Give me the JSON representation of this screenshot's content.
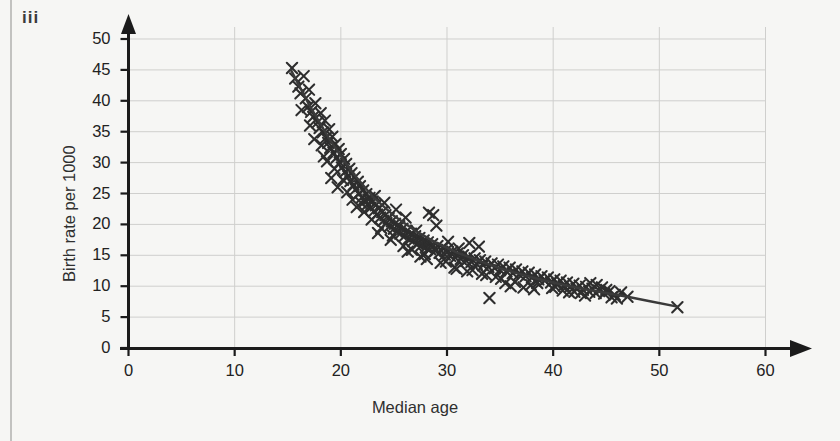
{
  "figure": {
    "part_label": "iii",
    "clipped_heading_above": "ggg",
    "background_color": "#f6f6f4",
    "marker_color": "#2e2e2e",
    "line_color": "#3a3a3a",
    "grid_color": "#cfcfcd",
    "axis_color": "#1b1b1b"
  },
  "chart_data": {
    "type": "scatter",
    "title": "",
    "xlabel": "Median age",
    "ylabel": "Birth rate per 1000",
    "xlim": [
      0,
      60
    ],
    "ylim": [
      0,
      50
    ],
    "xticks": [
      0,
      10,
      20,
      30,
      40,
      50,
      60
    ],
    "yticks": [
      0,
      5,
      10,
      15,
      20,
      25,
      30,
      35,
      40,
      45,
      50
    ],
    "grid": true,
    "legend": "none",
    "marker": "x",
    "series": [
      {
        "name": "Countries",
        "points": [
          [
            15.4,
            45.3
          ],
          [
            15.7,
            43.6
          ],
          [
            16.0,
            42.3
          ],
          [
            16.2,
            41.2
          ],
          [
            16.5,
            44.0
          ],
          [
            16.7,
            40.4
          ],
          [
            16.9,
            39.0
          ],
          [
            17.0,
            41.8
          ],
          [
            17.2,
            38.2
          ],
          [
            17.4,
            37.4
          ],
          [
            17.6,
            39.6
          ],
          [
            17.8,
            36.5
          ],
          [
            18.0,
            35.6
          ],
          [
            18.1,
            38.0
          ],
          [
            18.3,
            34.9
          ],
          [
            18.5,
            36.8
          ],
          [
            18.6,
            34.0
          ],
          [
            18.8,
            33.2
          ],
          [
            18.9,
            35.4
          ],
          [
            19.0,
            32.4
          ],
          [
            19.2,
            34.2
          ],
          [
            19.3,
            31.6
          ],
          [
            19.5,
            33.0
          ],
          [
            19.6,
            30.8
          ],
          [
            19.8,
            32.2
          ],
          [
            19.9,
            30.0
          ],
          [
            20.0,
            31.4
          ],
          [
            20.1,
            29.2
          ],
          [
            20.3,
            30.6
          ],
          [
            20.4,
            28.5
          ],
          [
            20.5,
            29.8
          ],
          [
            20.7,
            27.8
          ],
          [
            20.8,
            29.0
          ],
          [
            20.9,
            27.0
          ],
          [
            21.0,
            28.3
          ],
          [
            21.2,
            26.4
          ],
          [
            21.3,
            27.6
          ],
          [
            21.4,
            25.7
          ],
          [
            21.6,
            26.9
          ],
          [
            21.7,
            25.0
          ],
          [
            21.8,
            26.2
          ],
          [
            22.0,
            24.4
          ],
          [
            22.1,
            25.5
          ],
          [
            22.3,
            23.8
          ],
          [
            22.4,
            24.9
          ],
          [
            22.5,
            23.2
          ],
          [
            22.7,
            24.3
          ],
          [
            22.8,
            22.7
          ],
          [
            23.0,
            23.7
          ],
          [
            23.1,
            22.1
          ],
          [
            23.3,
            23.1
          ],
          [
            23.4,
            21.6
          ],
          [
            23.6,
            22.6
          ],
          [
            23.7,
            21.1
          ],
          [
            23.9,
            22.0
          ],
          [
            24.0,
            20.6
          ],
          [
            24.2,
            21.5
          ],
          [
            24.3,
            20.2
          ],
          [
            24.5,
            21.0
          ],
          [
            24.6,
            19.7
          ],
          [
            24.8,
            20.5
          ],
          [
            25.0,
            19.3
          ],
          [
            25.1,
            20.1
          ],
          [
            25.3,
            18.9
          ],
          [
            25.5,
            19.7
          ],
          [
            25.6,
            18.5
          ],
          [
            25.8,
            19.3
          ],
          [
            26.0,
            18.1
          ],
          [
            26.2,
            18.9
          ],
          [
            26.4,
            17.7
          ],
          [
            26.6,
            18.5
          ],
          [
            26.8,
            17.3
          ],
          [
            27.0,
            18.1
          ],
          [
            27.2,
            16.9
          ],
          [
            27.4,
            17.8
          ],
          [
            27.6,
            16.6
          ],
          [
            27.8,
            17.4
          ],
          [
            28.0,
            16.3
          ],
          [
            28.2,
            17.1
          ],
          [
            28.4,
            16.0
          ],
          [
            28.6,
            16.8
          ],
          [
            28.9,
            15.7
          ],
          [
            29.1,
            16.5
          ],
          [
            29.3,
            15.4
          ],
          [
            29.6,
            16.2
          ],
          [
            29.8,
            15.1
          ],
          [
            30.0,
            15.9
          ],
          [
            30.3,
            14.9
          ],
          [
            30.5,
            15.6
          ],
          [
            30.8,
            14.6
          ],
          [
            31.0,
            15.3
          ],
          [
            31.3,
            14.4
          ],
          [
            31.5,
            15.0
          ],
          [
            31.8,
            14.1
          ],
          [
            32.0,
            14.8
          ],
          [
            32.3,
            13.9
          ],
          [
            32.6,
            14.5
          ],
          [
            32.8,
            13.6
          ],
          [
            33.1,
            14.2
          ],
          [
            33.4,
            13.4
          ],
          [
            33.6,
            14.0
          ],
          [
            33.9,
            13.1
          ],
          [
            34.2,
            13.7
          ],
          [
            34.5,
            12.9
          ],
          [
            34.8,
            13.5
          ],
          [
            35.0,
            12.6
          ],
          [
            35.3,
            13.2
          ],
          [
            35.6,
            12.4
          ],
          [
            35.9,
            13.0
          ],
          [
            36.2,
            12.1
          ],
          [
            36.5,
            12.7
          ],
          [
            36.8,
            11.9
          ],
          [
            37.1,
            12.4
          ],
          [
            37.4,
            11.6
          ],
          [
            37.7,
            12.2
          ],
          [
            38.0,
            11.4
          ],
          [
            38.3,
            11.9
          ],
          [
            38.6,
            11.1
          ],
          [
            38.9,
            11.6
          ],
          [
            39.2,
            10.9
          ],
          [
            39.5,
            11.4
          ],
          [
            39.8,
            10.6
          ],
          [
            40.1,
            11.1
          ],
          [
            40.4,
            10.4
          ],
          [
            40.7,
            10.9
          ],
          [
            41.0,
            10.1
          ],
          [
            41.3,
            10.6
          ],
          [
            41.6,
            9.9
          ],
          [
            41.9,
            10.4
          ],
          [
            42.2,
            9.6
          ],
          [
            42.5,
            10.1
          ],
          [
            42.8,
            9.4
          ],
          [
            43.1,
            9.9
          ],
          [
            43.4,
            9.1
          ],
          [
            43.7,
            9.6
          ],
          [
            44.0,
            8.9
          ],
          [
            44.3,
            9.3
          ],
          [
            44.8,
            8.8
          ],
          [
            45.3,
            9.2
          ],
          [
            45.8,
            8.6
          ],
          [
            46.4,
            9.0
          ],
          [
            47.0,
            8.3
          ],
          [
            51.7,
            6.6
          ],
          [
            22.2,
            22.0
          ],
          [
            23.2,
            24.6
          ],
          [
            24.1,
            23.5
          ],
          [
            25.2,
            22.4
          ],
          [
            26.1,
            21.1
          ],
          [
            27.1,
            19.0
          ],
          [
            28.3,
            21.9
          ],
          [
            28.7,
            21.5
          ],
          [
            29.0,
            19.8
          ],
          [
            30.1,
            17.2
          ],
          [
            31.1,
            16.1
          ],
          [
            32.1,
            17.0
          ],
          [
            33.0,
            16.4
          ],
          [
            34.0,
            8.1
          ],
          [
            38.2,
            9.5
          ],
          [
            20.6,
            25.2
          ],
          [
            21.9,
            23.5
          ],
          [
            22.6,
            24.0
          ],
          [
            23.8,
            19.4
          ],
          [
            24.9,
            18.2
          ],
          [
            26.3,
            15.6
          ],
          [
            27.9,
            15.2
          ],
          [
            29.4,
            13.8
          ],
          [
            30.7,
            13.0
          ],
          [
            31.9,
            12.4
          ],
          [
            33.3,
            12.0
          ],
          [
            35.1,
            11.2
          ],
          [
            36.4,
            10.7
          ],
          [
            37.9,
            10.2
          ],
          [
            39.9,
            9.7
          ],
          [
            41.5,
            9.0
          ],
          [
            43.0,
            8.5
          ],
          [
            44.6,
            9.8
          ],
          [
            46.0,
            8.0
          ],
          [
            18.4,
            31.0
          ],
          [
            19.4,
            29.0
          ],
          [
            20.2,
            27.2
          ],
          [
            21.1,
            24.0
          ],
          [
            22.9,
            20.8
          ],
          [
            24.7,
            17.5
          ],
          [
            16.3,
            38.5
          ],
          [
            17.5,
            33.8
          ],
          [
            18.7,
            30.2
          ],
          [
            19.1,
            27.5
          ],
          [
            25.9,
            16.5
          ],
          [
            27.5,
            14.8
          ],
          [
            29.9,
            14.0
          ],
          [
            32.4,
            12.6
          ],
          [
            34.6,
            11.5
          ],
          [
            36.0,
            10.0
          ],
          [
            37.2,
            9.8
          ],
          [
            40.9,
            9.3
          ],
          [
            42.6,
            8.9
          ],
          [
            44.1,
            10.2
          ],
          [
            45.0,
            9.4
          ],
          [
            17.1,
            36.0
          ],
          [
            18.2,
            32.8
          ],
          [
            19.7,
            26.0
          ],
          [
            21.5,
            22.8
          ],
          [
            23.5,
            18.6
          ],
          [
            26.7,
            15.9
          ],
          [
            28.1,
            14.4
          ],
          [
            30.9,
            12.8
          ],
          [
            33.7,
            11.8
          ],
          [
            35.5,
            10.5
          ],
          [
            38.5,
            10.5
          ],
          [
            40.2,
            9.9
          ],
          [
            42.0,
            9.1
          ],
          [
            43.5,
            10.5
          ],
          [
            45.5,
            8.2
          ]
        ]
      }
    ],
    "trendline": {
      "name": "fitted curve",
      "points": [
        [
          15.3,
          45.0
        ],
        [
          17.0,
          39.4
        ],
        [
          19.0,
          33.6
        ],
        [
          21.0,
          28.6
        ],
        [
          23.0,
          24.5
        ],
        [
          25.0,
          21.4
        ],
        [
          27.0,
          19.0
        ],
        [
          29.0,
          17.0
        ],
        [
          31.0,
          15.4
        ],
        [
          33.0,
          14.1
        ],
        [
          35.0,
          12.9
        ],
        [
          37.0,
          11.9
        ],
        [
          39.0,
          11.0
        ],
        [
          41.0,
          10.2
        ],
        [
          43.0,
          9.5
        ],
        [
          45.0,
          8.9
        ],
        [
          47.0,
          8.3
        ],
        [
          49.0,
          7.6
        ],
        [
          51.7,
          6.7
        ]
      ]
    }
  }
}
